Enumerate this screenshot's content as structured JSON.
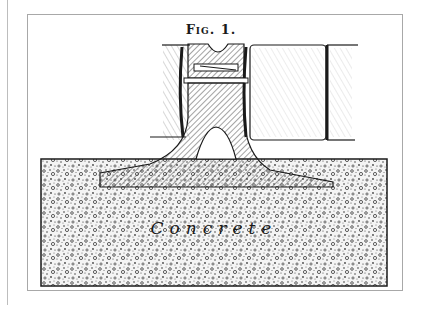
{
  "figure": {
    "caption": "Fig. 1.",
    "label_concrete": "Concrete",
    "colors": {
      "ink": "#1a1a1a",
      "frame": "#a8a8a8",
      "paper": "#ffffff"
    }
  }
}
